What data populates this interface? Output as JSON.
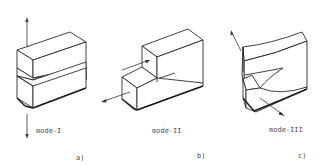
{
  "diagram": {
    "panels": [
      {
        "id": "a",
        "mode_label": "mode-I",
        "sub_label": "a)",
        "description": "Opening mode: crack faces pulled apart vertically"
      },
      {
        "id": "b",
        "mode_label": "mode-II",
        "sub_label": "b)",
        "description": "Sliding mode: in-plane shear of crack faces"
      },
      {
        "id": "c",
        "mode_label": "mode-III",
        "sub_label": "c)",
        "description": "Tearing mode: out-of-plane shear of crack faces"
      }
    ],
    "colors": {
      "line": "#2b2b2b",
      "text": "#4a4a4a",
      "background": "#ffffff"
    }
  }
}
